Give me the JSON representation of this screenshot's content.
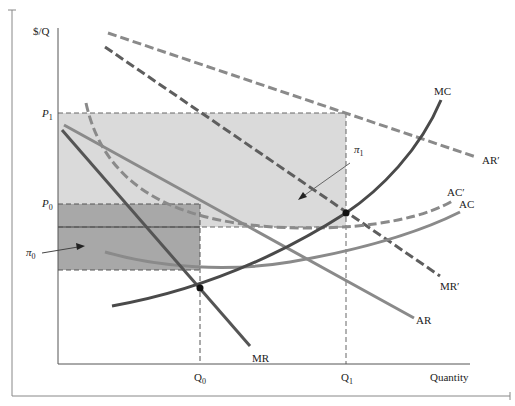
{
  "diagram": {
    "type": "economics-monopoly-profit",
    "y_axis_label": "$/Q",
    "x_axis_label": "Quantity",
    "price_labels": [
      {
        "id": "P1",
        "base": "P",
        "sub": "1"
      },
      {
        "id": "P0",
        "base": "P",
        "sub": "0"
      }
    ],
    "quantity_labels": [
      {
        "id": "Q0",
        "base": "Q",
        "sub": "0"
      },
      {
        "id": "Q1",
        "base": "Q",
        "sub": "1"
      }
    ],
    "profit_labels": [
      {
        "id": "pi0",
        "base": "π",
        "sub": "0"
      },
      {
        "id": "pi1",
        "base": "π",
        "sub": "1"
      }
    ],
    "curves": [
      {
        "id": "MC",
        "label": "MC",
        "style": "solid",
        "color": "#4a4a4a"
      },
      {
        "id": "AC",
        "label": "AC",
        "style": "solid",
        "color": "#8a8a8a"
      },
      {
        "id": "AR",
        "label": "AR",
        "style": "solid",
        "color": "#8a8a8a"
      },
      {
        "id": "MR",
        "label": "MR",
        "style": "solid",
        "color": "#5a5a5a"
      },
      {
        "id": "AC_prime",
        "label": "AC′",
        "style": "dashed",
        "color": "#8a8a8a"
      },
      {
        "id": "AR_prime",
        "label": "AR′",
        "style": "dashed",
        "color": "#8a8a8a"
      },
      {
        "id": "MR_prime",
        "label": "MR′",
        "style": "dashed",
        "color": "#5a5a5a"
      }
    ],
    "regions": [
      {
        "id": "pi1_region",
        "label": "π1",
        "color": "#d9d9d9"
      },
      {
        "id": "pi0_region",
        "label": "π0",
        "color": "#a9a9a9"
      }
    ],
    "equilibrium_points": [
      {
        "id": "eq0",
        "desc": "MC = MR at Q0"
      },
      {
        "id": "eq1",
        "desc": "MC = MR′ at Q1"
      }
    ]
  }
}
